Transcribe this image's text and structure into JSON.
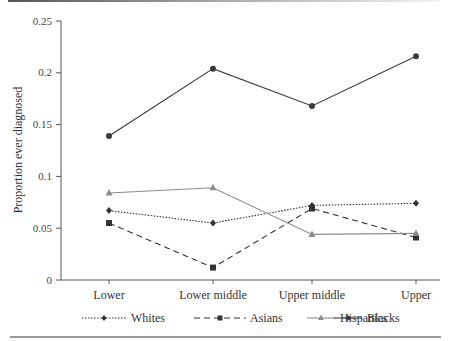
{
  "chart_data": {
    "type": "line",
    "title": "",
    "xlabel": "",
    "ylabel": "Proportion ever diagnosed",
    "categories": [
      "Lower",
      "Lower middle",
      "Upper middle",
      "Upper"
    ],
    "ylim": [
      0,
      0.25
    ],
    "yticks": [
      0,
      0.05,
      0.1,
      0.15,
      0.2,
      0.25
    ],
    "ytick_labels": [
      "0",
      "0.05",
      "0.1",
      "0.15",
      "0.2",
      "0.25"
    ],
    "grid": false,
    "legend_position": "bottom",
    "series": [
      {
        "name": "Whites",
        "values": [
          0.067,
          0.055,
          0.072,
          0.074
        ],
        "line": "dotted",
        "marker": "diamond",
        "color": "#333333"
      },
      {
        "name": "Asians",
        "values": [
          0.055,
          0.012,
          0.069,
          0.041
        ],
        "line": "dashed",
        "marker": "square",
        "color": "#333333"
      },
      {
        "name": "Hispanics",
        "values": [
          0.084,
          0.089,
          0.044,
          0.045
        ],
        "line": "solid",
        "marker": "triangle",
        "color": "#8c8c8c"
      },
      {
        "name": "Blacks",
        "values": [
          0.139,
          0.204,
          0.168,
          0.216
        ],
        "line": "solid",
        "marker": "circle",
        "color": "#3a3a3a"
      }
    ]
  }
}
